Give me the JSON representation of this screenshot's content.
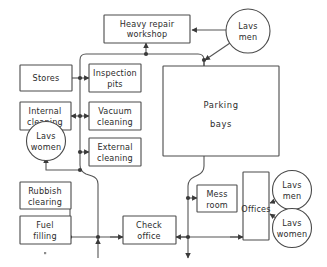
{
  "diagram": {
    "colors": {
      "background": "#ffffff",
      "box_stroke": "#4a4a4a",
      "connector": "#555555",
      "text": "#2b2b2b"
    },
    "nodes": [
      {
        "id": "heavy_repair",
        "shape": "box",
        "label_line1": "Heavy  repair",
        "label_line2": "workshop"
      },
      {
        "id": "lavs_men_top",
        "shape": "circle",
        "label_line1": "Lavs",
        "label_line2": "men"
      },
      {
        "id": "stores",
        "shape": "box",
        "label_line1": "Stores",
        "label_line2": ""
      },
      {
        "id": "inspection_pits",
        "shape": "box",
        "label_line1": "Inspection",
        "label_line2": "pits"
      },
      {
        "id": "internal_cleaning",
        "shape": "box",
        "label_line1": "Internal",
        "label_line2": "cleaning"
      },
      {
        "id": "vacuum_cleaning",
        "shape": "box",
        "label_line1": "Vacuum",
        "label_line2": "cleaning"
      },
      {
        "id": "lavs_women_left",
        "shape": "circle",
        "label_line1": "Lavs",
        "label_line2": "women"
      },
      {
        "id": "external_cleaning",
        "shape": "box",
        "label_line1": "External",
        "label_line2": "cleaning"
      },
      {
        "id": "parking_bays",
        "shape": "box",
        "label_line1": "Parking",
        "label_line2": "bays"
      },
      {
        "id": "rubbish_clearing",
        "shape": "box",
        "label_line1": "Rubbish",
        "label_line2": "clearing"
      },
      {
        "id": "fuel_filling",
        "shape": "box",
        "label_line1": "Fuel",
        "label_line2": "filling"
      },
      {
        "id": "check_office",
        "shape": "box",
        "label_line1": "Check",
        "label_line2": "office"
      },
      {
        "id": "mess_room",
        "shape": "box",
        "label_line1": "Mess",
        "label_line2": "room"
      },
      {
        "id": "offices",
        "shape": "box",
        "label_line1": "Offices",
        "label_line2": ""
      },
      {
        "id": "lavs_men_bottom",
        "shape": "circle",
        "label_line1": "Lavs",
        "label_line2": "men"
      },
      {
        "id": "lavs_women_bottom",
        "shape": "circle",
        "label_line1": "Lavs",
        "label_line2": "women"
      }
    ]
  }
}
